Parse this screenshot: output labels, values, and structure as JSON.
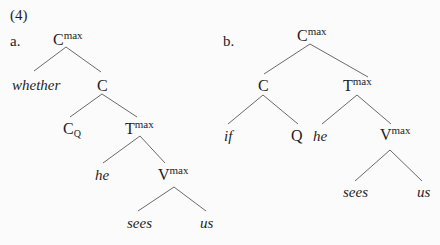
{
  "example": {
    "number": "(4)"
  },
  "tree_a": {
    "label": "a.",
    "root": {
      "cat": "C",
      "sup": "max"
    },
    "whether": "whether",
    "c_bar": {
      "cat": "C"
    },
    "c_q": {
      "cat": "C",
      "sub": "Q"
    },
    "t_max": {
      "cat": "T",
      "sup": "max"
    },
    "he": "he",
    "v_max": {
      "cat": "V",
      "sup": "max"
    },
    "sees": "sees",
    "us": "us"
  },
  "tree_b": {
    "label": "b.",
    "root": {
      "cat": "C",
      "sup": "max"
    },
    "c": {
      "cat": "C"
    },
    "t_max": {
      "cat": "T",
      "sup": "max"
    },
    "if": "if",
    "q": "Q",
    "he": "he",
    "v_max": {
      "cat": "V",
      "sup": "max"
    },
    "sees": "sees",
    "us": "us"
  },
  "style": {
    "background": "#fbfbfb",
    "text_color": "#1e1e1e",
    "line_color": "#6a6a6a"
  }
}
